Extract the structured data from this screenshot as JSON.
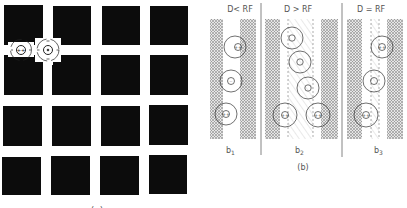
{
  "figure": {
    "panel_a": {
      "caption": "(a)",
      "grid": {
        "rows": 4,
        "cols": 4,
        "square_color": "#0c0c0c",
        "background": "#ffffff"
      },
      "receptive_fields": [
        {
          "position": "street-intersection-left",
          "center_sign": "++",
          "surround": "-"
        },
        {
          "position": "street-intersection",
          "center_sign": "+",
          "surround": "-"
        }
      ]
    },
    "panel_b": {
      "caption": "(b)",
      "subpanels": [
        {
          "id": "b1",
          "label": "b",
          "subscript": "1",
          "condition": "D< RF"
        },
        {
          "id": "b2",
          "label": "b",
          "subscript": "2",
          "condition": "D > RF"
        },
        {
          "id": "b3",
          "label": "b",
          "subscript": "3",
          "condition": "D = RF"
        }
      ]
    }
  }
}
